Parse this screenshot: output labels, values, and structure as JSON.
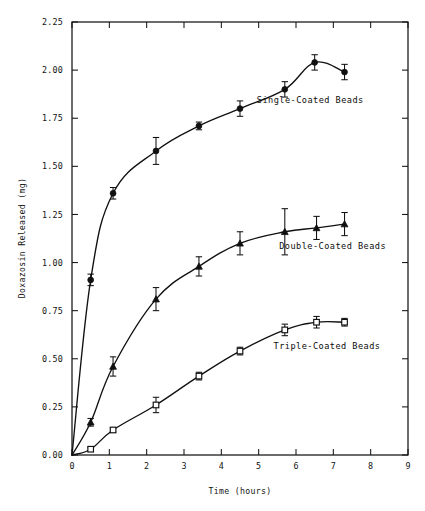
{
  "chart_data": {
    "type": "line",
    "title": "",
    "xlabel": "Time (hours)",
    "ylabel": "Doxazosin Released (mg)",
    "xlim": [
      0,
      9
    ],
    "ylim": [
      0,
      2.25
    ],
    "xticks": [
      0,
      1,
      2,
      3,
      4,
      5,
      6,
      7,
      8,
      9
    ],
    "xticklabels": [
      "0",
      "1",
      "2",
      "3",
      "4",
      "5",
      "6",
      "7",
      "8",
      "9"
    ],
    "yticks": [
      0.0,
      0.25,
      0.5,
      0.75,
      1.0,
      1.25,
      1.5,
      1.75,
      2.0,
      2.25
    ],
    "yticklabels": [
      "0.00",
      "0.25",
      "0.50",
      "0.75",
      "1.00",
      "1.25",
      "1.50",
      "1.75",
      "2.00",
      "2.25"
    ],
    "grid": false,
    "legend_position": "inline-annotations",
    "frame": "box-all-sides-inward-ticks",
    "series": [
      {
        "name": "Single-Coated Beads",
        "marker": "filled-circle",
        "annotation": "Single-Coated Beads",
        "annotation_xy": [
          4.95,
          1.83
        ],
        "x": [
          0.0,
          0.5,
          1.1,
          2.25,
          3.4,
          4.5,
          5.7,
          6.5,
          7.3
        ],
        "y": [
          0.0,
          0.91,
          1.36,
          1.58,
          1.71,
          1.8,
          1.9,
          2.04,
          1.99
        ],
        "yerr": [
          0.0,
          0.03,
          0.03,
          0.07,
          0.02,
          0.04,
          0.04,
          0.04,
          0.04
        ]
      },
      {
        "name": "Double-Coated Beads",
        "marker": "filled-triangle",
        "annotation": "Double-Coated Beads",
        "annotation_xy": [
          5.55,
          1.07
        ],
        "x": [
          0.0,
          0.5,
          1.1,
          2.25,
          3.4,
          4.5,
          5.7,
          6.55,
          7.3
        ],
        "y": [
          0.0,
          0.17,
          0.46,
          0.81,
          0.98,
          1.1,
          1.16,
          1.18,
          1.2
        ],
        "yerr": [
          0.0,
          0.02,
          0.05,
          0.06,
          0.05,
          0.06,
          0.12,
          0.06,
          0.06
        ]
      },
      {
        "name": "Triple-Coated Beads",
        "marker": "open-square",
        "annotation": "Triple-Coated Beads",
        "annotation_xy": [
          5.4,
          0.55
        ],
        "x": [
          0.0,
          0.5,
          1.1,
          2.25,
          3.4,
          4.5,
          5.7,
          6.55,
          7.3
        ],
        "y": [
          0.0,
          0.03,
          0.13,
          0.26,
          0.41,
          0.54,
          0.65,
          0.69,
          0.69
        ],
        "yerr": [
          0.0,
          0.01,
          0.01,
          0.04,
          0.02,
          0.02,
          0.03,
          0.03,
          0.02
        ]
      }
    ]
  },
  "figure": {
    "background_color": "#ffffff",
    "ink_color": "#111111"
  }
}
